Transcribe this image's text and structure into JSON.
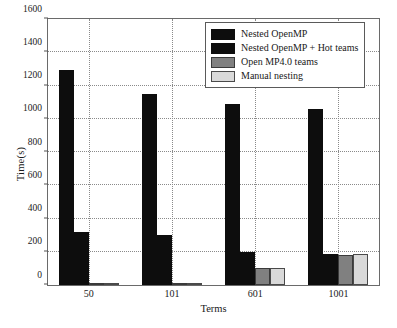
{
  "chart_data": {
    "type": "bar",
    "title": "",
    "xlabel": "Terms",
    "ylabel": "Time(s)",
    "categories": [
      "50",
      "101",
      "601",
      "1001"
    ],
    "ylim": [
      0,
      1600
    ],
    "yticks": [
      0,
      200,
      400,
      600,
      800,
      1000,
      1200,
      1400,
      1600
    ],
    "ytick_labels": [
      "0",
      "200",
      "400",
      "600",
      "800",
      "1000",
      "1200",
      "1400",
      "1600"
    ],
    "grid": true,
    "legend_position": "top-right",
    "series": [
      {
        "name": "Nested OpenMP",
        "color": "#0d0d0d",
        "values": [
          1295,
          1150,
          1090,
          1060
        ]
      },
      {
        "name": "Nested OpenMP + Hot teams",
        "color": "#0d0d0d",
        "values": [
          320,
          300,
          200,
          185
        ]
      },
      {
        "name": "Open MP4.0 teams",
        "color": "#808080",
        "values": [
          5,
          12,
          100,
          180
        ]
      },
      {
        "name": "Manual nesting",
        "color": "#d9d9d9",
        "values": [
          5,
          12,
          100,
          185
        ]
      }
    ]
  }
}
